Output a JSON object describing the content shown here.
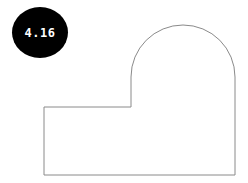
{
  "badge": {
    "label": "4.16",
    "background": "#000000",
    "text_color": "#ffffff"
  },
  "shape": {
    "stroke": "#8a8a8a",
    "fill": "#ffffff",
    "description": "Outline of an L-shaped base rectangle with a semicircular-topped tower on the right",
    "points": {
      "left_x": 44,
      "step_x": 131,
      "right_x": 235,
      "bottom_y": 175,
      "step_y": 107,
      "arc_start_y": 77,
      "arc_radius": 52
    }
  }
}
